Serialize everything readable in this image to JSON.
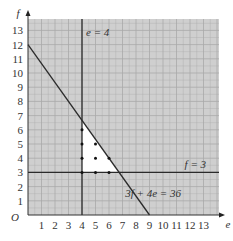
{
  "chart_data": {
    "type": "line",
    "title": "",
    "xlabel": "e",
    "ylabel": "f",
    "origin_label": "O",
    "xlim": [
      0,
      14
    ],
    "ylim": [
      0,
      14
    ],
    "x_ticks": [
      1,
      2,
      3,
      4,
      5,
      6,
      7,
      8,
      9,
      10,
      11,
      12,
      13
    ],
    "y_ticks": [
      1,
      2,
      3,
      4,
      5,
      6,
      7,
      8,
      9,
      10,
      11,
      12,
      13
    ],
    "grid": true,
    "lines": [
      {
        "name": "e = 4",
        "type": "vertical",
        "x": 4
      },
      {
        "name": "f = 3",
        "type": "horizontal",
        "y": 3
      },
      {
        "name": "3f + 4e = 36",
        "type": "segment",
        "points": [
          [
            0,
            12
          ],
          [
            9,
            0
          ]
        ]
      }
    ],
    "feasible_region": {
      "vertices": [
        [
          4,
          3
        ],
        [
          6.75,
          3
        ],
        [
          4,
          6.667
        ]
      ],
      "fill": "#ffffff"
    },
    "lattice_points": [
      [
        4,
        3
      ],
      [
        4,
        4
      ],
      [
        4,
        5
      ],
      [
        4,
        6
      ],
      [
        5,
        3
      ],
      [
        5,
        4
      ],
      [
        5,
        5
      ],
      [
        6,
        3
      ],
      [
        6,
        4
      ]
    ],
    "annotations": [
      {
        "text": "e = 4",
        "x": 4.3,
        "y": 12.6
      },
      {
        "text": "f = 3",
        "x": 11.6,
        "y": 3.3
      },
      {
        "text": "3f + 4e = 36",
        "x": 7.2,
        "y": 1.3
      }
    ]
  },
  "colors": {
    "plot_bg": "#cfcfcf",
    "grid": "#a9a9a9",
    "line": "#2b2b2b",
    "region": "#ffffff"
  }
}
